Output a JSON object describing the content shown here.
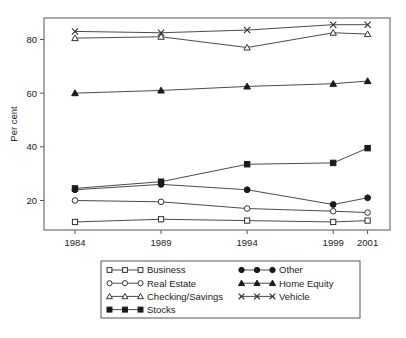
{
  "chart_data": {
    "type": "line",
    "title": "",
    "subtitle": "",
    "xlabel": "",
    "ylabel": "Per cent",
    "x": [
      1984,
      1989,
      1994,
      1999,
      2001
    ],
    "categories": [
      "1984",
      "1989",
      "1994",
      "1999",
      "2001"
    ],
    "xlim": [
      1982.2,
      2002.3
    ],
    "ylim": [
      9.0,
      88.0
    ],
    "yticks": [
      20,
      40,
      60,
      80
    ],
    "ytick_labels": [
      "20",
      "40",
      "60",
      "80"
    ],
    "xticks": [
      1984,
      1989,
      1994,
      1999,
      2001
    ],
    "xtick_labels": [
      "1984",
      "1989",
      "1994",
      "1999",
      "2001"
    ],
    "grid": false,
    "legend_position": "below-center",
    "legend_columns": 2,
    "series": [
      {
        "name": "Business",
        "marker": "open-square",
        "values": [
          12.0,
          13.0,
          12.5,
          12.0,
          12.5
        ]
      },
      {
        "name": "Real Estate",
        "marker": "open-circle",
        "values": [
          20.0,
          19.5,
          17.0,
          16.0,
          15.5
        ]
      },
      {
        "name": "Checking/Savings",
        "marker": "open-triangle",
        "values": [
          80.5,
          81.0,
          77.0,
          82.5,
          82.0
        ]
      },
      {
        "name": "Stocks",
        "marker": "filled-square",
        "values": [
          24.5,
          27.0,
          33.5,
          34.0,
          39.5
        ]
      },
      {
        "name": "Other",
        "marker": "filled-circle",
        "values": [
          24.0,
          26.0,
          24.0,
          18.5,
          21.0
        ]
      },
      {
        "name": "Home Equity",
        "marker": "filled-triangle",
        "values": [
          60.0,
          61.0,
          62.5,
          63.5,
          64.5
        ]
      },
      {
        "name": "Vehicle",
        "marker": "cross",
        "values": [
          83.0,
          82.5,
          83.5,
          85.5,
          85.5
        ]
      }
    ]
  },
  "legend": {
    "entries": [
      {
        "label": "Business",
        "marker": "open-square",
        "column": 0,
        "row": 0
      },
      {
        "label": "Real Estate",
        "marker": "open-circle",
        "column": 0,
        "row": 1
      },
      {
        "label": "Checking/Savings",
        "marker": "open-triangle",
        "column": 0,
        "row": 2
      },
      {
        "label": "Stocks",
        "marker": "filled-square",
        "column": 0,
        "row": 3
      },
      {
        "label": "Other",
        "marker": "filled-circle",
        "column": 1,
        "row": 0
      },
      {
        "label": "Home Equity",
        "marker": "filled-triangle",
        "column": 1,
        "row": 1
      },
      {
        "label": "Vehicle",
        "marker": "cross",
        "column": 1,
        "row": 2
      }
    ]
  },
  "colors": {
    "line": "#4a4a4a",
    "marker_stroke": "#303030",
    "marker_fill_open": "#ffffff",
    "marker_fill_solid": "#1a1a1a",
    "frame": "#555555",
    "text": "#1a1a1a",
    "background": "#ffffff"
  }
}
